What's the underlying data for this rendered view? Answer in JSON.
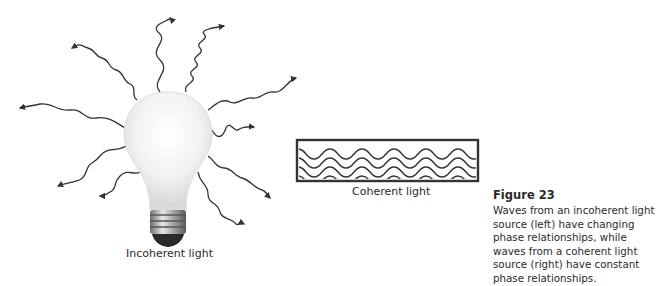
{
  "figure": {
    "number_label": "Figure 23",
    "caption": "Waves from an incoherent light source (left) have changing phase relationships, while waves from a coherent light source (right) have constant phase relationships."
  },
  "illustrations": {
    "incoherent": {
      "label": "Incoherent light",
      "icon": "light-bulb-icon",
      "wave_count": 10
    },
    "coherent": {
      "label": "Coherent light",
      "wave_count": 4
    }
  },
  "colors": {
    "wave_stroke": "#333333",
    "text": "#2a2a2a",
    "bulb_glass": "#f4f4f4",
    "bulb_base": "#8a8a8a"
  }
}
